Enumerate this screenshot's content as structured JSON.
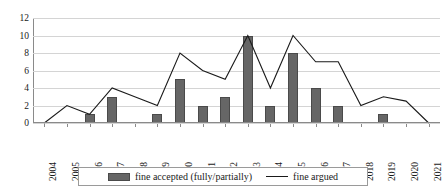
{
  "chart_data": {
    "type": "bar",
    "title": "",
    "subtitle": "",
    "xlabel": "",
    "ylabel": "",
    "categories": [
      "2004",
      "2005",
      "2006",
      "2007",
      "2008",
      "2009",
      "2010",
      "2011",
      "2012",
      "2013",
      "2014",
      "2015",
      "2016",
      "2017",
      "2018",
      "2019",
      "2020",
      "2021"
    ],
    "ylim": [
      0,
      12
    ],
    "yticks": [
      0,
      2,
      4,
      6,
      8,
      10,
      12
    ],
    "grid": true,
    "legend_position": "bottom",
    "series": [
      {
        "name": "fine accepted (fully/partially)",
        "type": "bar",
        "color": "#666666",
        "values": [
          0,
          0,
          1,
          3,
          0,
          1,
          5,
          2,
          3,
          10,
          2,
          8,
          4,
          2,
          0,
          1,
          0,
          0
        ]
      },
      {
        "name": "fine argued",
        "type": "line",
        "color": "#1a1a1a",
        "values": [
          0,
          2,
          1,
          4,
          3,
          2,
          8,
          6,
          5,
          10,
          4,
          10,
          7,
          7,
          2,
          3,
          2.5,
          0
        ]
      }
    ]
  },
  "legend": {
    "entries": [
      {
        "label": "fine accepted (fully/partially)",
        "marker": "bar-swatch"
      },
      {
        "label": "fine argued",
        "marker": "line-swatch"
      }
    ]
  },
  "axes": {
    "y_tick_labels": [
      "0",
      "2",
      "4",
      "6",
      "8",
      "10",
      "12"
    ],
    "x_tick_labels": [
      "2004",
      "2005",
      "2006",
      "2007",
      "2008",
      "2009",
      "2010",
      "2011",
      "2012",
      "2013",
      "2014",
      "2015",
      "2016",
      "2017",
      "2018",
      "2019",
      "2020",
      "2021"
    ]
  }
}
